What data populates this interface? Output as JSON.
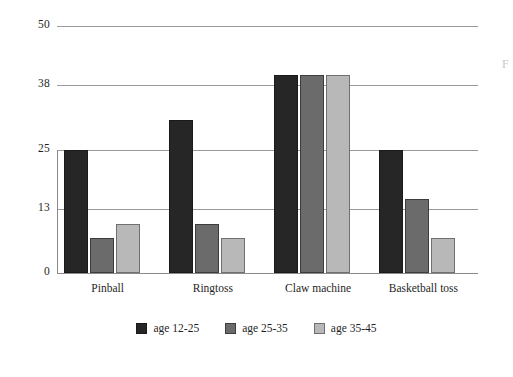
{
  "chart_data": {
    "type": "bar",
    "title": "",
    "subtitle": "",
    "xlabel": "",
    "ylabel": "",
    "categories": [
      "Pinball",
      "Ringtoss",
      "Claw machine",
      "Basketball toss"
    ],
    "series": [
      {
        "name": "age 12-25",
        "color": "#262626",
        "values": [
          25,
          31,
          40,
          25
        ]
      },
      {
        "name": "age 25-35",
        "color": "#6b6b6b",
        "values": [
          7,
          10,
          40,
          15
        ]
      },
      {
        "name": "age 35-45",
        "color": "#b8b8b8",
        "values": [
          10,
          7,
          40,
          7
        ]
      }
    ],
    "ylim": [
      0,
      50
    ],
    "yticks": [
      0,
      13,
      25,
      38,
      50
    ],
    "ytick_labels": [
      "0",
      "13",
      "25",
      "38",
      "50"
    ],
    "grid": true,
    "grid_axis": "y",
    "legend_position": "bottom",
    "annotations": []
  },
  "artifact": {
    "edge_mark": "F"
  }
}
